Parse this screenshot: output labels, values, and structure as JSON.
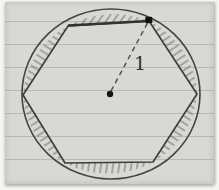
{
  "figure": {
    "radius_label": "1",
    "paper_color": "#d9d9d3",
    "ink_color": "#3c3c3c",
    "hatch_color": "#5f5f5f",
    "point_color": "#161616"
  }
}
